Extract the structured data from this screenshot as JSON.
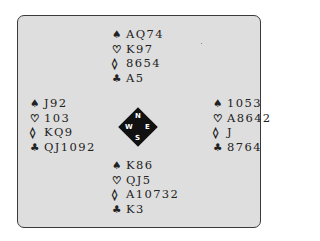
{
  "diagram": {
    "type": "bridge-deal",
    "suit_symbols": {
      "spades": "♠",
      "hearts": "♡",
      "diamonds": "◊",
      "clubs": "♣"
    },
    "compass": {
      "north": "N",
      "south": "S",
      "east": "E",
      "west": "W"
    },
    "hands": {
      "north": {
        "spades": "AQ74",
        "hearts": "K97",
        "diamonds": "8654",
        "clubs": "A5"
      },
      "west": {
        "spades": "J92",
        "hearts": "103",
        "diamonds": "KQ9",
        "clubs": "QJ1092"
      },
      "east": {
        "spades": "1053",
        "hearts": "A8642",
        "diamonds": "J",
        "clubs": "8764"
      },
      "south": {
        "spades": "K86",
        "hearts": "QJ5",
        "diamonds": "A10732",
        "clubs": "K3"
      }
    },
    "colors": {
      "background": "#dedede",
      "border": "#3a3a3a",
      "text": "#222222",
      "compass": "#111111"
    }
  }
}
